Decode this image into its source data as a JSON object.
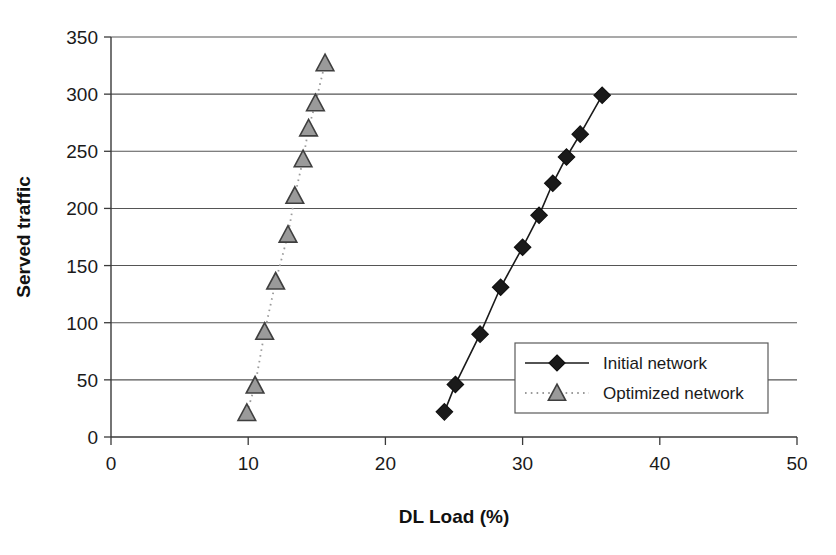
{
  "chart_data": {
    "type": "line",
    "title": "",
    "subtitle": "",
    "xlabel": "DL Load (%)",
    "ylabel": "Served traffic",
    "xlim": [
      0,
      50
    ],
    "ylim": [
      0,
      350
    ],
    "xticks": [
      "0",
      "10",
      "20",
      "30",
      "40",
      "50"
    ],
    "yticks": [
      "0",
      "50",
      "100",
      "150",
      "200",
      "250",
      "300",
      "350"
    ],
    "grid": "horizontal",
    "legend_position": "inside-bottom-right",
    "series": [
      {
        "name": "Initial network",
        "marker": "diamond",
        "marker_color": "#1a1a1a",
        "line_style": "solid",
        "line_color": "#1a1a1a",
        "points": [
          {
            "x": 24.3,
            "y": 22
          },
          {
            "x": 25.1,
            "y": 46
          },
          {
            "x": 26.9,
            "y": 90
          },
          {
            "x": 28.4,
            "y": 131
          },
          {
            "x": 30.0,
            "y": 166
          },
          {
            "x": 31.2,
            "y": 194
          },
          {
            "x": 32.2,
            "y": 222
          },
          {
            "x": 33.2,
            "y": 245
          },
          {
            "x": 34.2,
            "y": 265
          },
          {
            "x": 35.8,
            "y": 299
          }
        ]
      },
      {
        "name": "Optimized network",
        "marker": "triangle",
        "marker_color": "#9a9a9a",
        "line_style": "dotted",
        "line_color": "#9a9a9a",
        "points": [
          {
            "x": 9.9,
            "y": 21
          },
          {
            "x": 10.5,
            "y": 45
          },
          {
            "x": 11.2,
            "y": 92
          },
          {
            "x": 12.0,
            "y": 136
          },
          {
            "x": 12.9,
            "y": 177
          },
          {
            "x": 13.4,
            "y": 211
          },
          {
            "x": 14.0,
            "y": 243
          },
          {
            "x": 14.4,
            "y": 270
          },
          {
            "x": 14.9,
            "y": 292
          },
          {
            "x": 15.6,
            "y": 327
          }
        ]
      }
    ]
  },
  "legend": {
    "items": [
      {
        "label": "Initial network"
      },
      {
        "label": "Optimized network"
      }
    ]
  },
  "colors": {
    "initial": "#1a1a1a",
    "optimized": "#9a9a9a",
    "grid": "#555555",
    "axis": "#3a3a3a",
    "background": "#ffffff"
  }
}
